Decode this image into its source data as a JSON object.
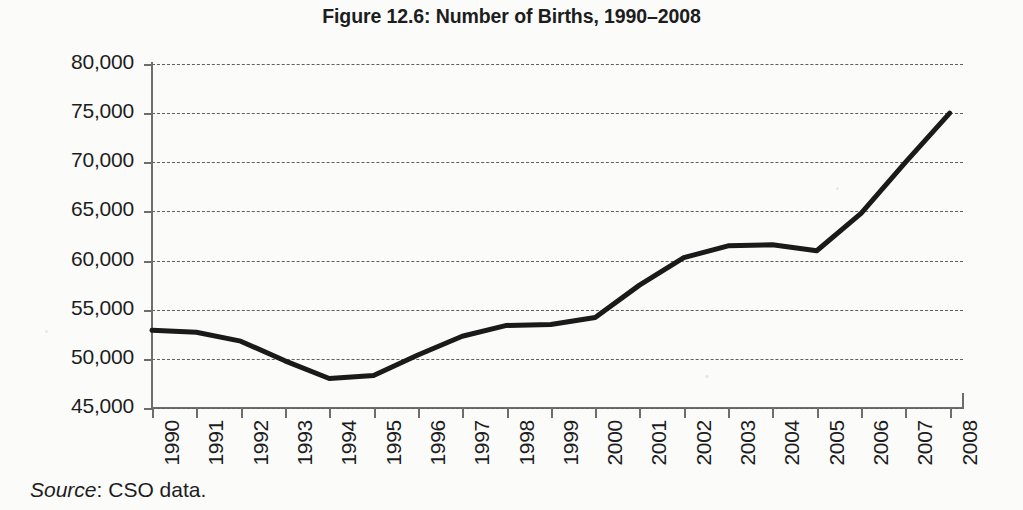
{
  "figure": {
    "title": "Figure 12.6: Number of Births, 1990–2008",
    "source_prefix": "Source",
    "source_separator": ": ",
    "source_text": "CSO data."
  },
  "chart_data": {
    "type": "line",
    "title": "Figure 12.6: Number of Births, 1990–2008",
    "xlabel": "",
    "ylabel": "",
    "categories": [
      "1990",
      "1991",
      "1992",
      "1993",
      "1994",
      "1995",
      "1996",
      "1997",
      "1998",
      "1999",
      "2000",
      "2001",
      "2002",
      "2003",
      "2004",
      "2005",
      "2006",
      "2007",
      "2008"
    ],
    "values": [
      52900,
      52700,
      51800,
      49800,
      48000,
      48300,
      50400,
      52300,
      53400,
      53500,
      54200,
      57500,
      60300,
      61500,
      61600,
      61000,
      64800,
      70000,
      75000
    ],
    "ylim": [
      45000,
      80000
    ],
    "ytick_values": [
      80000,
      75000,
      70000,
      65000,
      60000,
      55000,
      50000,
      45000
    ],
    "ytick_labels": [
      "80,000",
      "75,000",
      "70,000",
      "65,000",
      "60,000",
      "55,000",
      "50,000",
      "45,000"
    ],
    "ytick_step": 5000,
    "grid": true,
    "grid_axis": "y",
    "grid_style": "dashed",
    "legend": false,
    "legend_position": "none",
    "line_color": "#1a1a1a",
    "line_width": 5,
    "markers": false,
    "xtick_rotation": -90
  },
  "colors": {
    "background": "#fbfbfa",
    "axis": "#6d6d6d",
    "grid": "#5f5f5f",
    "line": "#1a1a1a",
    "text": "#1d1d1d"
  }
}
